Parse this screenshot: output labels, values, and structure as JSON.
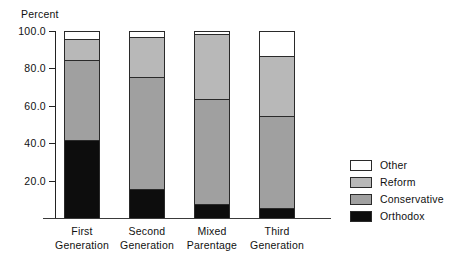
{
  "chart_data": {
    "type": "bar",
    "subtype": "stacked-bar",
    "title": "",
    "ylabel": "Percent",
    "xlabel": "",
    "ylim": [
      0,
      100
    ],
    "ytick_labels": [
      "100.0",
      "80.0",
      "60.0",
      "40.0",
      "20.0"
    ],
    "ytick_values": [
      100,
      80,
      60,
      40,
      20
    ],
    "grid": false,
    "legend_position": "right",
    "categories": [
      "First Generation",
      "Second Generation",
      "Mixed Parentage",
      "Third Generation"
    ],
    "category_lines": [
      [
        "First",
        "Generation"
      ],
      [
        "Second",
        "Generation"
      ],
      [
        "Mixed",
        "Parentage"
      ],
      [
        "Third",
        "Generation"
      ]
    ],
    "stack_order_bottom_to_top": [
      "Orthodox",
      "Conservative",
      "Reform",
      "Other"
    ],
    "series": [
      {
        "name": "Orthodox",
        "color": "#0d0d0d",
        "values": [
          41,
          15,
          7,
          5
        ]
      },
      {
        "name": "Conservative",
        "color": "#a0a0a0",
        "values": [
          43,
          60,
          56,
          49
        ]
      },
      {
        "name": "Reform",
        "color": "#b8b8b8",
        "values": [
          11,
          21,
          35,
          32
        ]
      },
      {
        "name": "Other",
        "color": "#ffffff",
        "values": [
          5,
          4,
          2,
          14
        ]
      }
    ],
    "cumulative_tops": {
      "Orthodox": [
        41,
        15,
        7,
        5
      ],
      "Conservative": [
        84,
        75,
        63,
        54
      ],
      "Reform": [
        95,
        96,
        98,
        86
      ],
      "Other": [
        100,
        100,
        100,
        100
      ]
    }
  },
  "legend": {
    "entries": [
      {
        "label": "Other",
        "color": "#ffffff"
      },
      {
        "label": "Reform",
        "color": "#b8b8b8"
      },
      {
        "label": "Conservative",
        "color": "#a0a0a0"
      },
      {
        "label": "Orthodox",
        "color": "#0d0d0d"
      }
    ]
  }
}
